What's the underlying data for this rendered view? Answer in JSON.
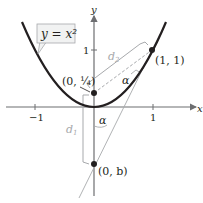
{
  "diagram": {
    "curve_label": "y = x²",
    "curve_equation": "y = x^2",
    "axes": {
      "x_label": "x",
      "y_label": "y",
      "x_ticks": [
        "−1",
        "1"
      ],
      "y_ticks": [
        "1"
      ]
    },
    "points": [
      {
        "label": "(0, 1/4)",
        "display": "(0, ¼)",
        "x": 0,
        "y": 0.25
      },
      {
        "label": "(1, 1)",
        "x": 1,
        "y": 1
      },
      {
        "label": "(0, b)",
        "x": 0,
        "y": "b"
      }
    ],
    "distances": [
      "d1",
      "d2"
    ],
    "angle_label": "α",
    "colors": {
      "curve": "#231f20",
      "axes": "#6d6e71",
      "construction": "#a7a9ac",
      "callout_fill": "#f1f2f2"
    }
  }
}
